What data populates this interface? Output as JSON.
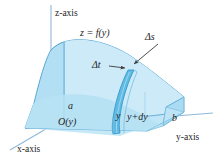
{
  "figure": {
    "background": "#ffffff",
    "colors": {
      "solid_fill_light": "#cbeaf7",
      "solid_fill_mid": "#b4e0f4",
      "solid_fill_front": "#a9dcf2",
      "slab_fill": "#6fc2e6",
      "slab_fill_dark": "#4fb2de",
      "edge": "#5aa8d6",
      "axis": "#8fb8d8",
      "leader": "#3a3a3a",
      "text": "#1d1d1d"
    },
    "axes": [
      {
        "name": "z-axis",
        "label": "z-axis"
      },
      {
        "name": "y-axis",
        "label": "y-axis"
      },
      {
        "name": "x-axis",
        "label": "x-axis"
      }
    ],
    "labels": {
      "surface": "z = f(y)",
      "delta_s": "Δs",
      "delta_t": "Δt",
      "cross_section": "O(y)",
      "a": "a",
      "b": "b",
      "y": "y",
      "y_plus_dy": "y+dy"
    }
  }
}
